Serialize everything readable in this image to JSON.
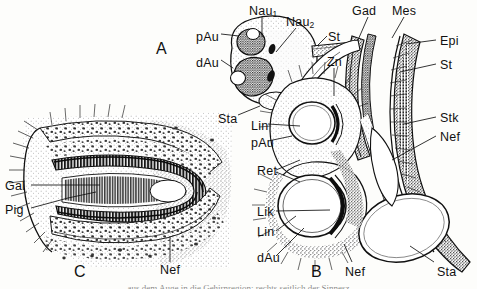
{
  "figure": {
    "width": 477,
    "height": 289,
    "background": "#fdfdfb",
    "ink": "#1a1a1a",
    "type": "anatomical-line-drawing",
    "caption_clipped": "aus dem Auge in die Gehirnregion; rechts seitlich der Sinnesz"
  },
  "panels": [
    {
      "id": "A",
      "letter": "A",
      "x": 156,
      "y": 41
    },
    {
      "id": "B",
      "letter": "B",
      "x": 311,
      "y": 264
    },
    {
      "id": "C",
      "letter": "C",
      "x": 74,
      "y": 264
    }
  ],
  "labels": [
    {
      "key": "nau1",
      "text": "Nau",
      "sub": "1",
      "x": 249,
      "y": 5,
      "panel": "A"
    },
    {
      "key": "nau2",
      "text": "Nau",
      "sub": "2",
      "x": 286,
      "y": 16,
      "panel": "A"
    },
    {
      "key": "pau_a",
      "text": "pAu",
      "sub": "",
      "x": 196,
      "y": 31,
      "panel": "A"
    },
    {
      "key": "dau_a",
      "text": "dAu",
      "sub": "",
      "x": 196,
      "y": 57,
      "panel": "A"
    },
    {
      "key": "st_a",
      "text": "St",
      "sub": "",
      "x": 328,
      "y": 31,
      "panel": "A"
    },
    {
      "key": "sta_a",
      "text": "Sta",
      "sub": "",
      "x": 218,
      "y": 113,
      "panel": "A"
    },
    {
      "key": "zn",
      "text": "Zn",
      "sub": "",
      "x": 327,
      "y": 56,
      "panel": "B"
    },
    {
      "key": "gad",
      "text": "Gad",
      "sub": "",
      "x": 352,
      "y": 5,
      "panel": "B"
    },
    {
      "key": "mes",
      "text": "Mes",
      "sub": "",
      "x": 392,
      "y": 5,
      "panel": "B"
    },
    {
      "key": "epi",
      "text": "Epi",
      "sub": "",
      "x": 440,
      "y": 35,
      "panel": "B"
    },
    {
      "key": "st_b",
      "text": "St",
      "sub": "",
      "x": 440,
      "y": 59,
      "panel": "B"
    },
    {
      "key": "stk",
      "text": "Stk",
      "sub": "",
      "x": 440,
      "y": 112,
      "panel": "B"
    },
    {
      "key": "nef_b1",
      "text": "Nef",
      "sub": "",
      "x": 440,
      "y": 131,
      "panel": "B"
    },
    {
      "key": "lin_b1",
      "text": "Lin",
      "sub": "",
      "x": 251,
      "y": 120,
      "panel": "B"
    },
    {
      "key": "pau_b",
      "text": "pAu",
      "sub": "",
      "x": 251,
      "y": 137,
      "panel": "B"
    },
    {
      "key": "ret",
      "text": "Ret",
      "sub": "",
      "x": 257,
      "y": 165,
      "panel": "B"
    },
    {
      "key": "lik",
      "text": "Lik",
      "sub": "",
      "x": 257,
      "y": 206,
      "panel": "B"
    },
    {
      "key": "lin_b2",
      "text": "Lin",
      "sub": "",
      "x": 257,
      "y": 226,
      "panel": "B"
    },
    {
      "key": "dau_b",
      "text": "dAu",
      "sub": "",
      "x": 257,
      "y": 252,
      "panel": "B"
    },
    {
      "key": "nef_b2",
      "text": "Nef",
      "sub": "",
      "x": 345,
      "y": 266,
      "panel": "B"
    },
    {
      "key": "sta_b",
      "text": "Sta",
      "sub": "",
      "x": 437,
      "y": 266,
      "panel": "B"
    },
    {
      "key": "gal",
      "text": "Gal",
      "sub": "",
      "x": 5,
      "y": 180,
      "panel": "C"
    },
    {
      "key": "pig",
      "text": "Pig",
      "sub": "",
      "x": 5,
      "y": 204,
      "panel": "C"
    },
    {
      "key": "nef_c",
      "text": "Nef",
      "sub": "",
      "x": 160,
      "y": 264,
      "panel": "C"
    }
  ],
  "legend_terms": {
    "Nau": "Nervus auricularis",
    "pAu": "proximales Auge",
    "dAu": "distales Auge",
    "St": "Stiel",
    "Sta": "Statocyste",
    "Zn": "Zentralnerv",
    "Gad": "Ganglion dorsale",
    "Mes": "Mesoderm",
    "Epi": "Epidermis",
    "Stk": "Stuetzkoerper",
    "Nef": "Nervenfasern",
    "Lin": "Linse",
    "Ret": "Retina",
    "Lik": "Linsenkern",
    "Gal": "Ganglienlage",
    "Pig": "Pigment"
  }
}
